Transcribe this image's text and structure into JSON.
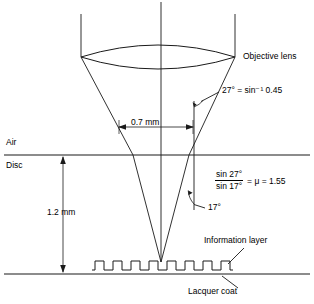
{
  "figure": {
    "labels": {
      "objective_lens": "Objective lens",
      "air": "Air",
      "disc": "Disc",
      "information_layer": "Information layer",
      "lacquer_coat": "Lacquer coat",
      "beam_width": "0.7 mm",
      "disc_thickness": "1.2 mm",
      "angle_air": "27° = sin⁻¹ 0.45",
      "angle_disc": "17°"
    },
    "formula": {
      "numerator": "sin 27°",
      "denominator": "sin 17°",
      "equals": "= μ = 1.55",
      "mu_symbol": "μ",
      "mu_value": "1.55"
    },
    "values": {
      "aperture_angle_air_deg": 27,
      "aperture_angle_disc_deg": 17,
      "numerical_aperture": 0.45,
      "refractive_index": 1.55,
      "beam_diameter_mm": 0.7,
      "substrate_thickness_mm": 1.2
    },
    "colors": {
      "stroke": "#1a1a1a",
      "background": "#ffffff",
      "text": "#000000"
    }
  }
}
